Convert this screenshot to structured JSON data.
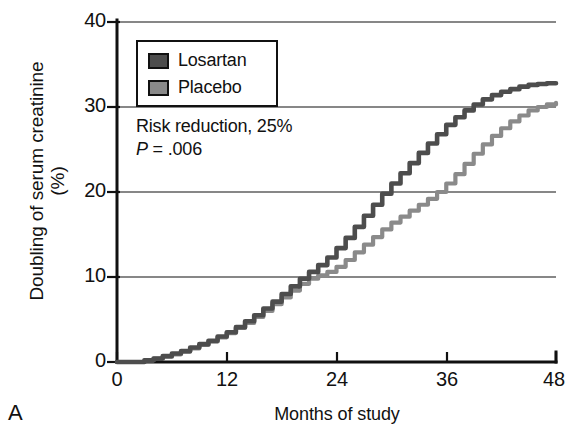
{
  "figure": {
    "panel_letter": "A"
  },
  "legend": {
    "items": [
      {
        "label": "Losartan",
        "color": "#4d4d4d"
      },
      {
        "label": "Placebo",
        "color": "#8a8a8a"
      }
    ]
  },
  "annotation": {
    "risk_reduction": "Risk reduction, 25%",
    "p_symbol": "P",
    "p_rest": " = .006"
  },
  "chart_data": {
    "type": "line",
    "title": "",
    "subtitle": "",
    "xlabel": "Months of study",
    "ylabel": "Doubling of serum creatinine (%)",
    "xlim": [
      0,
      48
    ],
    "ylim": [
      0,
      40
    ],
    "xticks": [
      0,
      12,
      24,
      36,
      48
    ],
    "yticks": [
      0,
      10,
      20,
      30,
      40
    ],
    "xtick_labels": [
      "0",
      "12",
      "24",
      "36",
      "48"
    ],
    "ytick_labels": [
      "0",
      "10",
      "20",
      "30",
      "40"
    ],
    "grid": "horizontal",
    "legend_position": "top-left-inside",
    "annotations": [
      "Risk reduction, 25%",
      "P = .006"
    ],
    "series": [
      {
        "name": "Losartan",
        "color": "#4d4d4d",
        "final_value": 32.8,
        "x": [
          0,
          1,
          2,
          3,
          4,
          5,
          6,
          7,
          8,
          9,
          10,
          11,
          12,
          13,
          14,
          15,
          16,
          17,
          18,
          19,
          20,
          21,
          22,
          23,
          24,
          25,
          26,
          27,
          28,
          29,
          30,
          31,
          32,
          33,
          34,
          35,
          36,
          37,
          38,
          39,
          40,
          41,
          42,
          43,
          44,
          45,
          46,
          47,
          48
        ],
        "y": [
          0,
          0,
          0,
          0.2,
          0.4,
          0.7,
          1.0,
          1.3,
          1.7,
          2.1,
          2.5,
          3.0,
          3.5,
          4.1,
          4.8,
          5.5,
          6.3,
          7.1,
          8.0,
          8.9,
          9.8,
          10.6,
          11.4,
          12.3,
          13.4,
          14.6,
          15.9,
          17.2,
          18.5,
          19.8,
          21.0,
          22.2,
          23.4,
          24.6,
          25.7,
          26.8,
          27.9,
          28.8,
          29.6,
          30.3,
          30.9,
          31.4,
          31.8,
          32.1,
          32.4,
          32.6,
          32.7,
          32.8,
          32.8
        ]
      },
      {
        "name": "Placebo",
        "color": "#8a8a8a",
        "final_value": 30.5,
        "x": [
          0,
          1,
          2,
          3,
          4,
          5,
          6,
          7,
          8,
          9,
          10,
          11,
          12,
          13,
          14,
          15,
          16,
          17,
          18,
          19,
          20,
          21,
          22,
          23,
          24,
          25,
          26,
          27,
          28,
          29,
          30,
          31,
          32,
          33,
          34,
          35,
          36,
          37,
          38,
          39,
          40,
          41,
          42,
          43,
          44,
          45,
          46,
          47,
          48
        ],
        "y": [
          0,
          0,
          0,
          0.2,
          0.4,
          0.6,
          0.9,
          1.2,
          1.6,
          2.0,
          2.4,
          2.9,
          3.4,
          4.0,
          4.6,
          5.3,
          6.0,
          6.8,
          7.6,
          8.4,
          9.2,
          9.8,
          10.2,
          10.6,
          11.2,
          12.0,
          12.9,
          13.8,
          14.7,
          15.6,
          16.4,
          17.1,
          17.8,
          18.5,
          19.2,
          20.0,
          21.0,
          22.1,
          23.3,
          24.5,
          25.6,
          26.6,
          27.5,
          28.3,
          29.0,
          29.6,
          30.0,
          30.3,
          30.5
        ]
      }
    ]
  }
}
